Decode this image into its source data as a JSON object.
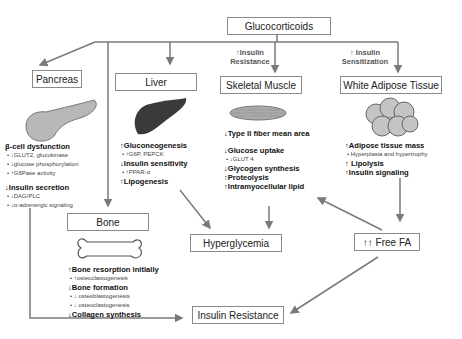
{
  "title": "Glucocorticoids",
  "side_labels": {
    "insulin_resistance": [
      "↑Insulin",
      "Resistance"
    ],
    "insulin_sensitization": [
      "↑ Insulin",
      "Sensitization"
    ]
  },
  "organs": {
    "pancreas": {
      "label": "Pancreas",
      "items": [
        {
          "text": "β-cell dysfunction",
          "type": "head"
        },
        {
          "text": "•  ↓GLUT2, glucokinase",
          "type": "sub"
        },
        {
          "text": "•  ↓glucose phosphorylation",
          "type": "sub"
        },
        {
          "text": "•  ↑G6Pase activity",
          "type": "sub"
        },
        {
          "text": "↓Insulin secretion",
          "type": "head"
        },
        {
          "text": "•  ↓DAG/PLC",
          "type": "sub"
        },
        {
          "text": "•  ↓α-adrenergic signaling",
          "type": "sub"
        }
      ]
    },
    "liver": {
      "label": "Liver",
      "items": [
        {
          "text": "↑Gluconeogenesis",
          "type": "head"
        },
        {
          "text": "•   ↑G6P, PEPCK",
          "type": "sub"
        },
        {
          "text": "↓Insulin sensitivity",
          "type": "head"
        },
        {
          "text": "•   ↑PPAR-α",
          "type": "sub"
        },
        {
          "text": "↑Lipogenesis",
          "type": "head"
        }
      ]
    },
    "skeletal_muscle": {
      "label": "Skeletal Muscle",
      "items": [
        {
          "text": "↓Type II fiber mean area",
          "type": "head"
        },
        {
          "text": "↓Glucose uptake",
          "type": "head"
        },
        {
          "text": "•   ↓GLUT 4",
          "type": "sub"
        },
        {
          "text": "↓Glycogen synthesis",
          "type": "head"
        },
        {
          "text": "↑Proteolysis",
          "type": "head"
        },
        {
          "text": "↑Intramyocellular lipid",
          "type": "head"
        }
      ]
    },
    "white_adipose": {
      "label": "White Adipose Tissue",
      "items": [
        {
          "text": "↑Adipose tissue mass",
          "type": "head"
        },
        {
          "text": "•     Hyperplasia and hypertrophy",
          "type": "sub"
        },
        {
          "text": "↑ Lipolysis",
          "type": "head"
        },
        {
          "text": "↑Insulin  signaling",
          "type": "head"
        }
      ]
    },
    "bone": {
      "label": "Bone",
      "items": [
        {
          "text": "↑Bone resorption initially",
          "type": "head"
        },
        {
          "text": "•  ↑osteoclastogenesis",
          "type": "sub"
        },
        {
          "text": "↓Bone formation",
          "type": "head"
        },
        {
          "text": "•  ↓ osteoblastogenesis",
          "type": "sub"
        },
        {
          "text": "•  ↓ osteoclastogenesis",
          "type": "sub"
        },
        {
          "text": "↓Collagen synthesis",
          "type": "head"
        }
      ]
    }
  },
  "outcomes": {
    "hyperglycemia": "Hyperglycemia",
    "free_fa": "↑↑ Free FA",
    "insulin_resistance": "Insulin Resistance"
  },
  "colors": {
    "line": "#7a7a7a",
    "box_border": "#8a8a8a",
    "organ_gray": "#9a9a9a",
    "liver_dark": "#3a3a3a"
  }
}
